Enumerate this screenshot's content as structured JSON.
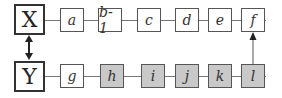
{
  "diagram": {
    "top_row": {
      "head": "X",
      "nodes": [
        {
          "label": "a",
          "shaded": false
        },
        {
          "label": "b-1",
          "shaded": false
        },
        {
          "label": "c",
          "shaded": false
        },
        {
          "label": "d",
          "shaded": false
        },
        {
          "label": "e",
          "shaded": false
        },
        {
          "label": "f",
          "shaded": false
        }
      ]
    },
    "bottom_row": {
      "head": "Y",
      "nodes": [
        {
          "label": "g",
          "shaded": false
        },
        {
          "label": "h",
          "shaded": true
        },
        {
          "label": "i",
          "shaded": true
        },
        {
          "label": "j",
          "shaded": true
        },
        {
          "label": "k",
          "shaded": true
        },
        {
          "label": "l",
          "shaded": true
        }
      ]
    },
    "connections": [
      {
        "from": "X",
        "to": "Y",
        "type": "bidirectional-arrow"
      },
      {
        "from": "l",
        "to": "f",
        "type": "arrow"
      }
    ],
    "colors": {
      "shaded_fill": "#c9c9c9",
      "border": "#555555"
    }
  }
}
